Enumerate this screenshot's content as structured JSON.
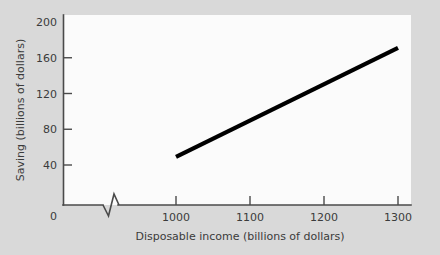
{
  "chart_data": {
    "type": "line",
    "title": "",
    "xlabel": "Disposable income (billions of dollars)",
    "ylabel": "Saving  (billions of dollars)",
    "xlim": [
      1000,
      1300
    ],
    "ylim": [
      0,
      200
    ],
    "x_ticks": [
      1000,
      1100,
      1200,
      1300
    ],
    "x_tick_labels": [
      "1000",
      "1100",
      "1200",
      "1300"
    ],
    "y_ticks": [
      0,
      40,
      80,
      120,
      160,
      200
    ],
    "y_tick_labels": [
      "0",
      "40",
      "80",
      "120",
      "160",
      "200"
    ],
    "grid": false,
    "legend": false,
    "axis_break_x": true,
    "origin_label": "0",
    "series": [
      {
        "name": "Saving function",
        "color": "#000000",
        "x": [
          1000,
          1300
        ],
        "values": [
          49,
          171
        ]
      }
    ],
    "colors": {
      "background": "#d9d9d9",
      "plot_background": "#fbfbfb",
      "axis": "#4a4a4a",
      "line": "#000000",
      "text": "#3b3b3b"
    }
  }
}
